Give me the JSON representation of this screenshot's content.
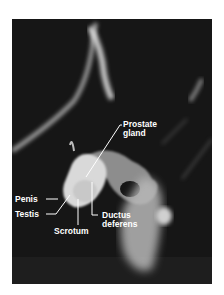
{
  "figure": {
    "background_color": "#161616",
    "label_color": "#ffffff",
    "labels": [
      {
        "id": "prostate",
        "line1": "Prostate",
        "line2": "gland"
      },
      {
        "id": "penis",
        "line1": "Penis"
      },
      {
        "id": "testis",
        "line1": "Testis"
      },
      {
        "id": "scrotum",
        "line1": "Scrotum"
      },
      {
        "id": "ductus",
        "line1": "Ductus",
        "line2": "deferens"
      }
    ]
  }
}
